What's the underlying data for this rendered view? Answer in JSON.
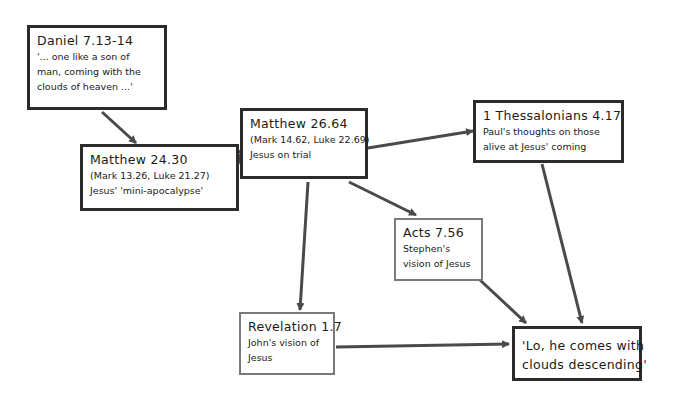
{
  "diagram": {
    "colors": {
      "arrow": "#4a4a4a",
      "dark_border": "#2b2b2b",
      "light_border": "#7a7a7a",
      "background": "#ffffff"
    },
    "nodes": [
      {
        "id": "daniel",
        "title": "Daniel 7.13-14",
        "lines": [
          "'... one like a son of",
          "man, coming with the",
          "clouds of heaven ...'"
        ]
      },
      {
        "id": "matt2430",
        "title": "Matthew 24.30",
        "lines": [
          "(Mark 13.26, Luke 21.27)",
          "Jesus' 'mini-apocalypse'"
        ]
      },
      {
        "id": "matt2664",
        "title": "Matthew 26.64",
        "lines": [
          "(Mark 14.62, Luke 22.69)",
          "Jesus on trial"
        ]
      },
      {
        "id": "thess",
        "title": "1 Thessalonians 4.17",
        "lines": [
          "Paul's thoughts on those",
          "alive at Jesus' coming"
        ]
      },
      {
        "id": "acts",
        "title": "Acts 7.56",
        "lines": [
          "Stephen's",
          "vision of Jesus"
        ]
      },
      {
        "id": "rev",
        "title": "Revelation 1.7",
        "lines": [
          "John's vision of",
          "Jesus"
        ]
      },
      {
        "id": "lo",
        "title": "",
        "lines": [
          "'Lo, he comes with",
          "clouds descending'"
        ]
      }
    ],
    "edges": [
      {
        "from": "daniel",
        "to": "matt2430"
      },
      {
        "from": "matt2430",
        "to": "matt2664"
      },
      {
        "from": "matt2664",
        "to": "thess"
      },
      {
        "from": "matt2664",
        "to": "acts"
      },
      {
        "from": "matt2664",
        "to": "rev"
      },
      {
        "from": "thess",
        "to": "lo"
      },
      {
        "from": "acts",
        "to": "lo"
      },
      {
        "from": "rev",
        "to": "lo"
      }
    ]
  }
}
